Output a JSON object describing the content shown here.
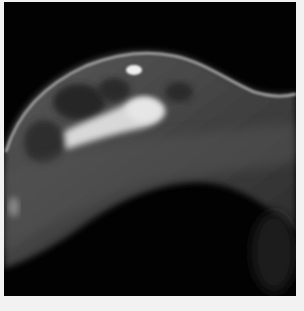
{
  "image": {
    "description": "Grayscale breast MRI slice showing curved breast tissue with bright fibroglandular regions against a black background",
    "colors": {
      "background": "#020202",
      "border": "#f2f2f2",
      "tissue_dark": "#3a3a3a",
      "tissue_mid": "#7a7a7a",
      "tissue_bright": "#e8e8e8"
    }
  }
}
